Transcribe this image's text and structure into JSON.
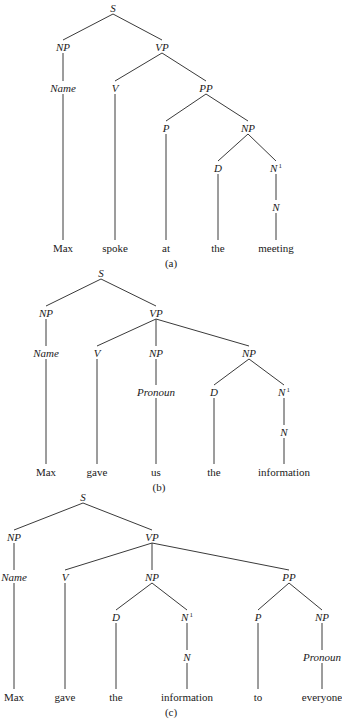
{
  "figure": {
    "trees": [
      {
        "id": "a",
        "caption": "(a)",
        "caption_pos": [
          171,
          267
        ],
        "sentence": "Max spoke at the meeting",
        "nodes": [
          {
            "id": "S",
            "label": "S",
            "x": 113,
            "y": 8,
            "kind": "cat"
          },
          {
            "id": "NP1",
            "label": "NP",
            "x": 63,
            "y": 47,
            "kind": "cat",
            "parent": "S"
          },
          {
            "id": "VP",
            "label": "VP",
            "x": 162,
            "y": 47,
            "kind": "cat",
            "parent": "S"
          },
          {
            "id": "Name",
            "label": "Name",
            "x": 63,
            "y": 88,
            "kind": "cat",
            "parent": "NP1"
          },
          {
            "id": "V",
            "label": "V",
            "x": 115,
            "y": 88,
            "kind": "cat",
            "parent": "VP"
          },
          {
            "id": "PP",
            "label": "PP",
            "x": 206,
            "y": 88,
            "kind": "cat",
            "parent": "VP"
          },
          {
            "id": "P",
            "label": "P",
            "x": 166,
            "y": 128,
            "kind": "cat",
            "parent": "PP"
          },
          {
            "id": "NP2",
            "label": "NP",
            "x": 248,
            "y": 128,
            "kind": "cat",
            "parent": "PP"
          },
          {
            "id": "D",
            "label": "D",
            "x": 218,
            "y": 168,
            "kind": "cat",
            "parent": "NP2"
          },
          {
            "id": "N1",
            "label": "N",
            "sup": "1",
            "x": 276,
            "y": 168,
            "kind": "cat",
            "parent": "NP2"
          },
          {
            "id": "N",
            "label": "N",
            "x": 276,
            "y": 207,
            "kind": "cat",
            "parent": "N1"
          },
          {
            "id": "w1",
            "label": "Max",
            "x": 63,
            "y": 248,
            "kind": "word",
            "parent": "Name"
          },
          {
            "id": "w2",
            "label": "spoke",
            "x": 115,
            "y": 248,
            "kind": "word",
            "parent": "V"
          },
          {
            "id": "w3",
            "label": "at",
            "x": 166,
            "y": 248,
            "kind": "word",
            "parent": "P"
          },
          {
            "id": "w4",
            "label": "the",
            "x": 218,
            "y": 248,
            "kind": "word",
            "parent": "D"
          },
          {
            "id": "w5",
            "label": "meeting",
            "x": 276,
            "y": 248,
            "kind": "word",
            "parent": "N"
          }
        ]
      },
      {
        "id": "b",
        "caption": "(b)",
        "caption_pos": [
          159,
          491
        ],
        "sentence": "Max gave us the information",
        "nodes": [
          {
            "id": "S",
            "label": "S",
            "x": 101,
            "y": 273,
            "kind": "cat"
          },
          {
            "id": "NP1",
            "label": "NP",
            "x": 46,
            "y": 313,
            "kind": "cat",
            "parent": "S"
          },
          {
            "id": "VP",
            "label": "VP",
            "x": 156,
            "y": 313,
            "kind": "cat",
            "parent": "S"
          },
          {
            "id": "Name",
            "label": "Name",
            "x": 46,
            "y": 353,
            "kind": "cat",
            "parent": "NP1"
          },
          {
            "id": "V",
            "label": "V",
            "x": 97,
            "y": 353,
            "kind": "cat",
            "parent": "VP"
          },
          {
            "id": "NP2",
            "label": "NP",
            "x": 156,
            "y": 353,
            "kind": "cat",
            "parent": "VP"
          },
          {
            "id": "NP3",
            "label": "NP",
            "x": 249,
            "y": 353,
            "kind": "cat",
            "parent": "VP"
          },
          {
            "id": "Pronoun",
            "label": "Pronoun",
            "x": 156,
            "y": 392,
            "kind": "cat",
            "parent": "NP2"
          },
          {
            "id": "D",
            "label": "D",
            "x": 214,
            "y": 392,
            "kind": "cat",
            "parent": "NP3"
          },
          {
            "id": "N1",
            "label": "N",
            "sup": "1",
            "x": 284,
            "y": 392,
            "kind": "cat",
            "parent": "NP3"
          },
          {
            "id": "N",
            "label": "N",
            "x": 284,
            "y": 432,
            "kind": "cat",
            "parent": "N1"
          },
          {
            "id": "w1",
            "label": "Max",
            "x": 46,
            "y": 472,
            "kind": "word",
            "parent": "Name"
          },
          {
            "id": "w2",
            "label": "gave",
            "x": 97,
            "y": 472,
            "kind": "word",
            "parent": "V"
          },
          {
            "id": "w3",
            "label": "us",
            "x": 156,
            "y": 472,
            "kind": "word",
            "parent": "Pronoun"
          },
          {
            "id": "w4",
            "label": "the",
            "x": 214,
            "y": 472,
            "kind": "word",
            "parent": "D"
          },
          {
            "id": "w5",
            "label": "information",
            "x": 284,
            "y": 472,
            "kind": "word",
            "parent": "N"
          }
        ]
      },
      {
        "id": "c",
        "caption": "(c)",
        "caption_pos": [
          171,
          716
        ],
        "sentence": "Max gave the information to everyone",
        "nodes": [
          {
            "id": "S",
            "label": "S",
            "x": 83,
            "y": 497,
            "kind": "cat"
          },
          {
            "id": "NP1",
            "label": "NP",
            "x": 14,
            "y": 537,
            "kind": "cat",
            "parent": "S"
          },
          {
            "id": "VP",
            "label": "VP",
            "x": 152,
            "y": 537,
            "kind": "cat",
            "parent": "S"
          },
          {
            "id": "Name",
            "label": "Name",
            "x": 14,
            "y": 577,
            "kind": "cat",
            "parent": "NP1"
          },
          {
            "id": "V",
            "label": "V",
            "x": 65,
            "y": 577,
            "kind": "cat",
            "parent": "VP"
          },
          {
            "id": "NP2",
            "label": "NP",
            "x": 152,
            "y": 577,
            "kind": "cat",
            "parent": "VP"
          },
          {
            "id": "PP",
            "label": "PP",
            "x": 289,
            "y": 577,
            "kind": "cat",
            "parent": "VP"
          },
          {
            "id": "D",
            "label": "D",
            "x": 116,
            "y": 617,
            "kind": "cat",
            "parent": "NP2"
          },
          {
            "id": "N1",
            "label": "N",
            "sup": "1",
            "x": 187,
            "y": 617,
            "kind": "cat",
            "parent": "NP2"
          },
          {
            "id": "P",
            "label": "P",
            "x": 258,
            "y": 617,
            "kind": "cat",
            "parent": "PP"
          },
          {
            "id": "NP3",
            "label": "NP",
            "x": 322,
            "y": 617,
            "kind": "cat",
            "parent": "PP"
          },
          {
            "id": "N",
            "label": "N",
            "x": 187,
            "y": 657,
            "kind": "cat",
            "parent": "N1"
          },
          {
            "id": "Pronoun",
            "label": "Pronoun",
            "x": 322,
            "y": 657,
            "kind": "cat",
            "parent": "NP3"
          },
          {
            "id": "w1",
            "label": "Max",
            "x": 14,
            "y": 697,
            "kind": "word",
            "parent": "Name"
          },
          {
            "id": "w2",
            "label": "gave",
            "x": 65,
            "y": 697,
            "kind": "word",
            "parent": "V"
          },
          {
            "id": "w3",
            "label": "the",
            "x": 116,
            "y": 697,
            "kind": "word",
            "parent": "D"
          },
          {
            "id": "w4",
            "label": "information",
            "x": 187,
            "y": 697,
            "kind": "word",
            "parent": "N"
          },
          {
            "id": "w5",
            "label": "to",
            "x": 258,
            "y": 697,
            "kind": "word",
            "parent": "P"
          },
          {
            "id": "w6",
            "label": "everyone",
            "x": 322,
            "y": 697,
            "kind": "word",
            "parent": "Pronoun"
          }
        ]
      }
    ]
  }
}
